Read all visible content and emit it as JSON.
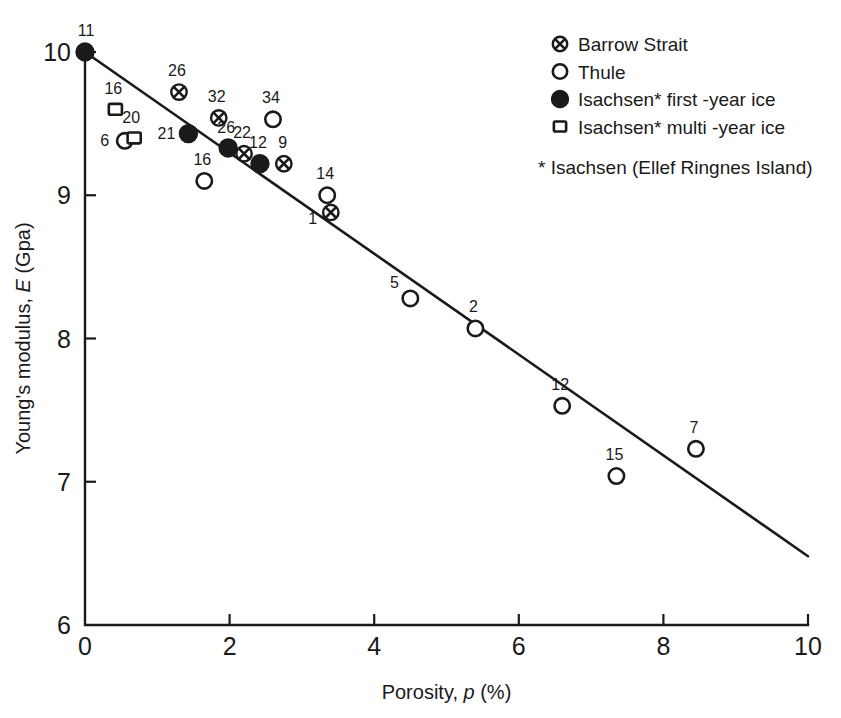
{
  "chart_data": {
    "type": "scatter",
    "title": "",
    "xlabel": "Porosity, p (%)",
    "xlabel_prefix": "Porosity, ",
    "xlabel_em": "p",
    "xlabel_suffix": " (%)",
    "ylabel": "Young's modulus, E (Gpa)",
    "ylabel_prefix": "Young's modulus, ",
    "ylabel_em": "E",
    "ylabel_suffix": " (Gpa)",
    "xlim": [
      0,
      10
    ],
    "ylim": [
      6,
      10
    ],
    "xticks": [
      0,
      2,
      4,
      6,
      8,
      10
    ],
    "yticks": [
      6,
      7,
      8,
      9,
      10
    ],
    "xtick_labels": [
      "0",
      "2",
      "4",
      "6",
      "8",
      "10"
    ],
    "ytick_labels": [
      "6",
      "7",
      "8",
      "9",
      "10"
    ],
    "grid": false,
    "legend_position": "top-right",
    "trend_line": {
      "name": "regression line",
      "x": [
        0,
        10
      ],
      "y": [
        10.0,
        6.48
      ]
    },
    "series": [
      {
        "name": "Barrow Strait",
        "marker": "crossed-circle",
        "points": [
          {
            "label": "26",
            "x": 1.3,
            "y": 9.72,
            "label_dx": -2,
            "label_dy": -16
          },
          {
            "label": "32",
            "x": 1.85,
            "y": 9.54,
            "label_dx": -2,
            "label_dy": -16
          },
          {
            "label": "22",
            "x": 2.2,
            "y": 9.29,
            "label_dx": -2,
            "label_dy": -16
          },
          {
            "label": "9",
            "x": 2.75,
            "y": 9.22,
            "label_dx": -1,
            "label_dy": -16
          },
          {
            "label": "1",
            "x": 3.4,
            "y": 8.88,
            "label_dx": -18,
            "label_dy": 12
          }
        ]
      },
      {
        "name": "Thule",
        "marker": "open-circle",
        "points": [
          {
            "label": "6",
            "x": 0.55,
            "y": 9.38,
            "label_dx": -20,
            "label_dy": 5
          },
          {
            "label": "34",
            "x": 2.6,
            "y": 9.53,
            "label_dx": -2,
            "label_dy": -16
          },
          {
            "label": "16",
            "x": 1.65,
            "y": 9.1,
            "label_dx": -2,
            "label_dy": -16
          },
          {
            "label": "14",
            "x": 3.35,
            "y": 9.0,
            "label_dx": -2,
            "label_dy": -16
          },
          {
            "label": "5",
            "x": 4.5,
            "y": 8.28,
            "label_dx": -16,
            "label_dy": -10
          },
          {
            "label": "2",
            "x": 5.4,
            "y": 8.07,
            "label_dx": -2,
            "label_dy": -16
          },
          {
            "label": "12",
            "x": 6.6,
            "y": 7.53,
            "label_dx": -2,
            "label_dy": -16
          },
          {
            "label": "15",
            "x": 7.35,
            "y": 7.04,
            "label_dx": -2,
            "label_dy": -16
          },
          {
            "label": "7",
            "x": 8.45,
            "y": 7.23,
            "label_dx": -2,
            "label_dy": -16
          }
        ]
      },
      {
        "name": "Isachsen* first -year ice",
        "marker": "filled-circle",
        "points": [
          {
            "label": "11",
            "x": 0.0,
            "y": 10.0,
            "label_dx": 1,
            "label_dy": -16
          },
          {
            "label": "21",
            "x": 1.43,
            "y": 9.43,
            "label_dx": -22,
            "label_dy": 5
          },
          {
            "label": "26",
            "x": 1.98,
            "y": 9.33,
            "label_dx": -2,
            "label_dy": -15
          },
          {
            "label": "12",
            "x": 2.42,
            "y": 9.22,
            "label_dx": -2,
            "label_dy": -16
          }
        ]
      },
      {
        "name": "Isachsen* multi -year ice",
        "marker": "open-square",
        "points": [
          {
            "label": "16",
            "x": 0.42,
            "y": 9.6,
            "label_dx": -2,
            "label_dy": -15
          },
          {
            "label": "20",
            "x": 0.68,
            "y": 9.4,
            "label_dx": -3,
            "label_dy": -15
          }
        ]
      }
    ],
    "legend": [
      {
        "label": "Barrow Strait",
        "marker": "crossed-circle"
      },
      {
        "label": "Thule",
        "marker": "open-circle"
      },
      {
        "label": "Isachsen* first -year ice",
        "marker": "filled-circle"
      },
      {
        "label": "Isachsen* multi -year ice",
        "marker": "open-square"
      }
    ],
    "footnote": "* Isachsen (Ellef Ringnes Island)",
    "colors": {
      "ink": "#1a1a1a",
      "background": "#ffffff"
    }
  }
}
